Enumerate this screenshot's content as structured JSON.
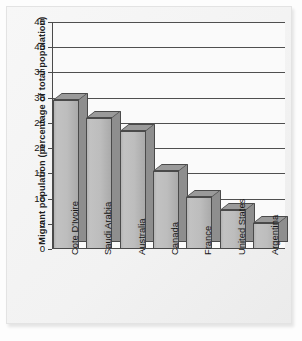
{
  "chart_data": {
    "type": "bar",
    "title": "",
    "xlabel": "",
    "ylabel": "Migrant population (percentage of total population)",
    "ylim": [
      0,
      45
    ],
    "yticks": [
      0,
      5,
      10,
      15,
      20,
      25,
      30,
      35,
      40,
      45
    ],
    "ytick_labels": [
      "0",
      "5",
      "10",
      "15",
      "20",
      "25",
      "30",
      "35",
      "40",
      "45"
    ],
    "grid": true,
    "legend": false,
    "legend_position": "none",
    "style": "3d-bar-grayscale",
    "categories": [
      "Cote D'Ivoire",
      "Saudi Arabia",
      "Australia",
      "Canada",
      "France",
      "United States",
      "Argentina"
    ],
    "values": [
      29.5,
      26.0,
      23.3,
      15.4,
      10.4,
      7.8,
      5.1
    ],
    "series": [
      {
        "name": "Migrant population",
        "values": [
          29.5,
          26.0,
          23.3,
          15.4,
          10.4,
          7.8,
          5.1
        ]
      }
    ],
    "colors": {
      "bar_front": "#bdbdbd",
      "bar_side": "#8e8e8e",
      "bar_top": "#9a9a9a",
      "bar_outline": "#4a4a4a",
      "gridline": "#4f4f4f",
      "axis": "#4a4a4a",
      "plot_background": "#fafafa",
      "page_background": "#f2f2f2",
      "text": "#141414"
    }
  }
}
